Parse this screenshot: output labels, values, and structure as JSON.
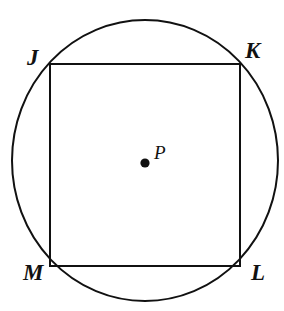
{
  "figure": {
    "background_color": "#ffffff",
    "stroke_color": "#111111",
    "labels": {
      "vertex_top_left": "J",
      "vertex_top_right": "K",
      "vertex_bottom_right": "L",
      "vertex_bottom_left": "M",
      "center_point": "P"
    },
    "shapes": {
      "circle": {
        "name": "circumscribed-circle",
        "center_x": 145,
        "center_y": 160.5,
        "radius_x": 133,
        "radius_y": 140.5,
        "stroke_width": 2,
        "fill": "none"
      },
      "square": {
        "name": "inscribed-square",
        "left": 50,
        "top": 64,
        "right": 240,
        "bottom": 266,
        "stroke_width": 2,
        "fill": "none"
      },
      "center_dot": {
        "name": "center-point-dot",
        "center_x": 145,
        "center_y": 163,
        "radius": 4.6,
        "fill": "#111111"
      }
    }
  }
}
